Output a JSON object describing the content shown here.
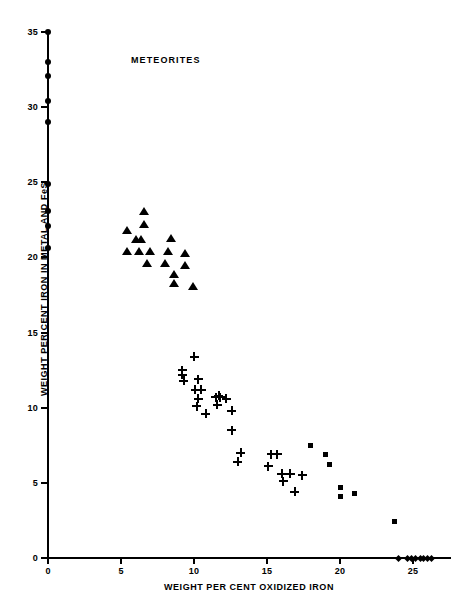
{
  "chart_data": {
    "type": "scatter",
    "title": "METEORITES",
    "xlabel": "WEIGHT PER CENT OXIDIZED IRON",
    "ylabel": "WEIGHT PER CENT IRON IN METAL AND FeS",
    "xlim": [
      0,
      27.5
    ],
    "ylim": [
      0,
      36
    ],
    "xticks": [
      0,
      5,
      10,
      15,
      20,
      25
    ],
    "yticks": [
      0,
      5,
      10,
      15,
      20,
      25,
      30,
      35
    ],
    "grid": false,
    "legend": "none",
    "series": [
      {
        "name": "irons",
        "marker": "circle",
        "points": [
          [
            0.0,
            35.0
          ],
          [
            0.0,
            33.0
          ],
          [
            0.0,
            32.1
          ],
          [
            0.0,
            30.4
          ],
          [
            0.0,
            29.0
          ],
          [
            0.0,
            24.9
          ],
          [
            0.0,
            23.1
          ],
          [
            0.0,
            22.1
          ],
          [
            0.0,
            20.6
          ]
        ]
      },
      {
        "name": "enstatite-and-olivine-bronzite-chondrites",
        "marker": "triangle",
        "points": [
          [
            6.6,
            23.1
          ],
          [
            6.6,
            22.2
          ],
          [
            5.4,
            21.8
          ],
          [
            6.0,
            21.2
          ],
          [
            6.4,
            21.2
          ],
          [
            8.4,
            21.3
          ],
          [
            5.4,
            20.4
          ],
          [
            6.2,
            20.4
          ],
          [
            7.0,
            20.4
          ],
          [
            8.2,
            20.4
          ],
          [
            9.4,
            20.3
          ],
          [
            6.8,
            19.6
          ],
          [
            8.0,
            19.6
          ],
          [
            9.4,
            19.5
          ],
          [
            8.6,
            18.9
          ],
          [
            8.6,
            18.3
          ],
          [
            9.9,
            18.1
          ]
        ]
      },
      {
        "name": "olivine-hypersthene-chondrites",
        "marker": "plus",
        "points": [
          [
            10.0,
            13.4
          ],
          [
            9.2,
            12.5
          ],
          [
            9.2,
            12.2
          ],
          [
            9.3,
            11.8
          ],
          [
            10.3,
            11.9
          ],
          [
            10.1,
            11.2
          ],
          [
            10.5,
            11.2
          ],
          [
            10.3,
            10.6
          ],
          [
            11.5,
            10.7
          ],
          [
            11.8,
            10.7
          ],
          [
            11.7,
            10.8
          ],
          [
            12.2,
            10.6
          ],
          [
            10.2,
            10.1
          ],
          [
            11.6,
            10.2
          ],
          [
            12.6,
            9.8
          ],
          [
            10.8,
            9.6
          ],
          [
            12.6,
            8.5
          ],
          [
            13.2,
            7.0
          ],
          [
            15.3,
            6.9
          ],
          [
            15.7,
            6.9
          ],
          [
            13.0,
            6.4
          ],
          [
            15.1,
            6.1
          ],
          [
            16.0,
            5.6
          ],
          [
            16.6,
            5.6
          ],
          [
            17.4,
            5.5
          ],
          [
            16.1,
            5.1
          ],
          [
            16.9,
            4.4
          ]
        ]
      },
      {
        "name": "carbonaceous-and-amphoterite-chondrites",
        "marker": "square",
        "points": [
          [
            18.0,
            7.5
          ],
          [
            19.0,
            6.9
          ],
          [
            19.3,
            6.2
          ],
          [
            20.0,
            4.7
          ],
          [
            20.0,
            4.1
          ],
          [
            21.0,
            4.3
          ],
          [
            23.7,
            2.4
          ]
        ]
      },
      {
        "name": "achondrites",
        "marker": "diamond",
        "points": [
          [
            24.0,
            0.0
          ],
          [
            24.6,
            0.0
          ],
          [
            24.9,
            0.0
          ],
          [
            25.2,
            0.0
          ],
          [
            25.5,
            0.0
          ],
          [
            25.7,
            0.0
          ],
          [
            26.0,
            0.0
          ],
          [
            26.3,
            0.0
          ]
        ]
      }
    ]
  },
  "axes": {
    "x": {
      "pixel_origin": 48,
      "pixel_per_unit": 14.6,
      "baseline_y": 558
    },
    "y": {
      "pixel_origin": 558,
      "pixel_per_unit": 15.03
    }
  }
}
